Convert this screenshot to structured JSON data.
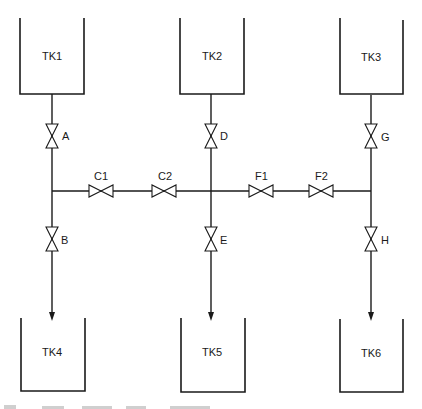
{
  "diagram": {
    "type": "piping-and-valve-schematic",
    "tanks": [
      {
        "id": "TK1",
        "label": "TK1",
        "row": "top",
        "column": 1
      },
      {
        "id": "TK2",
        "label": "TK2",
        "row": "top",
        "column": 2
      },
      {
        "id": "TK3",
        "label": "TK3",
        "row": "top",
        "column": 3
      },
      {
        "id": "TK4",
        "label": "TK4",
        "row": "bottom",
        "column": 1
      },
      {
        "id": "TK5",
        "label": "TK5",
        "row": "bottom",
        "column": 2
      },
      {
        "id": "TK6",
        "label": "TK6",
        "row": "bottom",
        "column": 3
      }
    ],
    "valves": [
      {
        "id": "A",
        "label": "A",
        "orientation": "vertical",
        "line": "TK1 outlet"
      },
      {
        "id": "B",
        "label": "B",
        "orientation": "vertical",
        "line": "to TK4"
      },
      {
        "id": "C1",
        "label": "C1",
        "orientation": "horizontal",
        "line": "header col1-col2"
      },
      {
        "id": "C2",
        "label": "C2",
        "orientation": "horizontal",
        "line": "header col1-col2"
      },
      {
        "id": "D",
        "label": "D",
        "orientation": "vertical",
        "line": "TK2 outlet"
      },
      {
        "id": "E",
        "label": "E",
        "orientation": "vertical",
        "line": "to TK5"
      },
      {
        "id": "F1",
        "label": "F1",
        "orientation": "horizontal",
        "line": "header col2-col3"
      },
      {
        "id": "F2",
        "label": "F2",
        "orientation": "horizontal",
        "line": "header col2-col3"
      },
      {
        "id": "G",
        "label": "G",
        "orientation": "vertical",
        "line": "TK3 outlet"
      },
      {
        "id": "H",
        "label": "H",
        "orientation": "vertical",
        "line": "to TK6"
      }
    ],
    "flows": [
      {
        "from": "TK1",
        "via": [
          "A",
          "B"
        ],
        "to": "TK4"
      },
      {
        "from": "TK2",
        "via": [
          "D",
          "E"
        ],
        "to": "TK5"
      },
      {
        "from": "TK3",
        "via": [
          "G",
          "H"
        ],
        "to": "TK6"
      },
      {
        "header": "horizontal cross-connect",
        "valves": [
          "C1",
          "C2",
          "F1",
          "F2"
        ]
      }
    ]
  }
}
